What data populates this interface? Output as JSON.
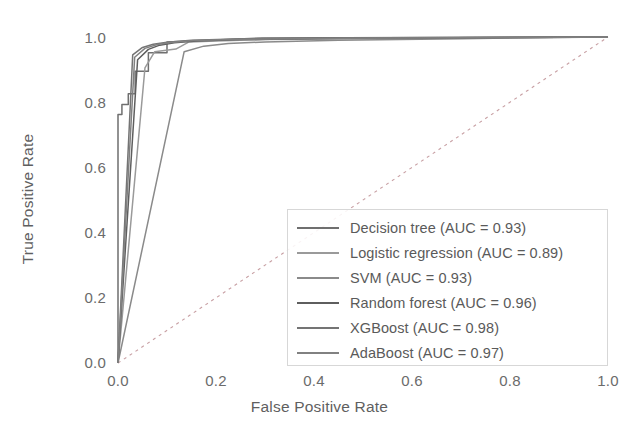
{
  "chart_data": {
    "type": "line",
    "title": "",
    "xlabel": "False Positive Rate",
    "ylabel": "True Positive Rate",
    "xlim": [
      0.0,
      1.0
    ],
    "ylim": [
      0.0,
      1.0
    ],
    "xticks": [
      "0.0",
      "0.2",
      "0.4",
      "0.6",
      "0.8",
      "1.0"
    ],
    "yticks": [
      "0.0",
      "0.2",
      "0.4",
      "0.6",
      "0.8",
      "1.0"
    ],
    "grid": false,
    "legend_position": "center-right",
    "reference_line": {
      "label": "chance-diagonal",
      "style": "dotted",
      "color": "#c8a0a4",
      "x": [
        0.0,
        1.0
      ],
      "y": [
        0.0,
        1.0
      ]
    },
    "series": [
      {
        "name": "Decision tree",
        "auc": "0.93",
        "legend_label": "Decision tree (AUC = 0.93)",
        "color": "#6f6f6f",
        "x": [
          0.0,
          0.0,
          0.008,
          0.008,
          0.021,
          0.021,
          0.035,
          0.035,
          0.062,
          0.062,
          0.1,
          0.1,
          0.295,
          1.0
        ],
        "y": [
          0.0,
          0.762,
          0.762,
          0.793,
          0.793,
          0.826,
          0.826,
          0.895,
          0.895,
          0.952,
          0.952,
          0.985,
          0.997,
          1.0
        ]
      },
      {
        "name": "Logistic regression",
        "auc": "0.89",
        "legend_label": "Logistic regression (AUC = 0.89)",
        "color": "#9a9a9a",
        "x": [
          0.0,
          0.055,
          0.075,
          0.118,
          0.145,
          0.2,
          0.3,
          0.5,
          1.0
        ],
        "y": [
          0.0,
          0.905,
          0.955,
          0.963,
          0.985,
          0.988,
          0.992,
          0.995,
          1.0
        ]
      },
      {
        "name": "SVM",
        "auc": "0.93",
        "legend_label": "SVM (AUC = 0.93)",
        "color": "#8a8a8a",
        "x": [
          0.0,
          0.135,
          0.175,
          0.225,
          0.3,
          0.45,
          0.7,
          1.0
        ],
        "y": [
          0.0,
          0.955,
          0.972,
          0.98,
          0.985,
          0.99,
          0.995,
          1.0
        ]
      },
      {
        "name": "Random forest",
        "auc": "0.96",
        "legend_label": "Random forest (AUC = 0.96)",
        "color": "#5e5e5e",
        "x": [
          0.0,
          0.04,
          0.062,
          0.085,
          0.115,
          0.16,
          0.25,
          0.45,
          1.0
        ],
        "y": [
          0.0,
          0.93,
          0.962,
          0.975,
          0.982,
          0.988,
          0.992,
          0.996,
          1.0
        ]
      },
      {
        "name": "XGBoost",
        "auc": "0.98",
        "legend_label": "XGBoost (AUC = 0.98)",
        "color": "#747474",
        "x": [
          0.0,
          0.03,
          0.05,
          0.072,
          0.1,
          0.15,
          0.24,
          0.42,
          1.0
        ],
        "y": [
          0.0,
          0.945,
          0.968,
          0.978,
          0.984,
          0.99,
          0.994,
          0.997,
          1.0
        ]
      },
      {
        "name": "AdaBoost",
        "auc": "0.97",
        "legend_label": "AdaBoost (AUC = 0.97)",
        "color": "#818181",
        "x": [
          0.0,
          0.034,
          0.055,
          0.08,
          0.108,
          0.155,
          0.255,
          0.46,
          1.0
        ],
        "y": [
          0.0,
          0.938,
          0.965,
          0.977,
          0.983,
          0.989,
          0.993,
          0.996,
          1.0
        ]
      }
    ]
  }
}
